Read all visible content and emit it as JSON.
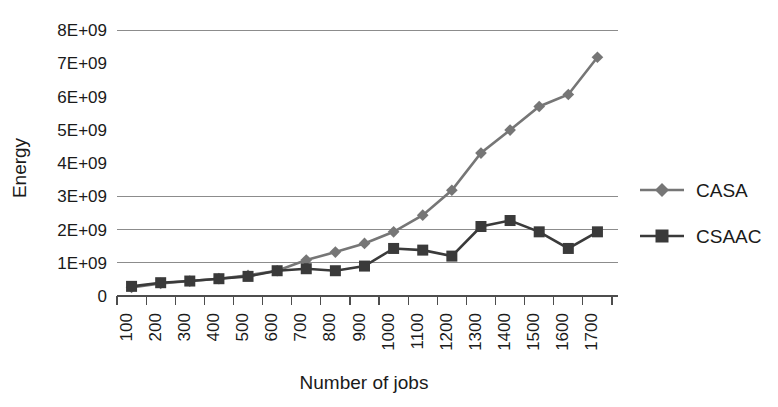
{
  "chart_data": {
    "type": "line",
    "title": "",
    "xlabel": "Number of jobs",
    "ylabel": "Energy",
    "x": [
      100,
      200,
      300,
      400,
      500,
      600,
      700,
      800,
      900,
      1000,
      1100,
      1200,
      1300,
      1400,
      1500,
      1600,
      1700
    ],
    "xtick_labels": [
      "100",
      "200",
      "300",
      "400",
      "500",
      "600",
      "700",
      "800",
      "900",
      "1000",
      "1100",
      "1200",
      "1300",
      "1400",
      "1500",
      "1600",
      "1700"
    ],
    "ytick_labels": [
      "0",
      "1E+09",
      "2E+09",
      "3E+09",
      "4E+09",
      "5E+09",
      "6E+09",
      "7E+09",
      "8E+09"
    ],
    "ytick_values": [
      0,
      1000000000,
      2000000000,
      3000000000,
      4000000000,
      5000000000,
      6000000000,
      7000000000,
      8000000000
    ],
    "ylim": [
      0,
      8000000000
    ],
    "grid": "horizontal",
    "gridlines_visible": [
      1000000000,
      2000000000,
      3000000000,
      8000000000
    ],
    "legend_position": "right",
    "series": [
      {
        "name": "CASA",
        "marker": "diamond",
        "color": "#767676",
        "values": [
          260000000,
          380000000,
          450000000,
          520000000,
          620000000,
          760000000,
          1080000000,
          1320000000,
          1580000000,
          1930000000,
          2430000000,
          3180000000,
          4300000000,
          4990000000,
          5700000000,
          6060000000,
          7180000000
        ]
      },
      {
        "name": "CSAAC",
        "marker": "square",
        "color": "#3a3a3a",
        "values": [
          290000000,
          400000000,
          450000000,
          520000000,
          590000000,
          760000000,
          820000000,
          760000000,
          900000000,
          1430000000,
          1380000000,
          1200000000,
          2090000000,
          2270000000,
          1930000000,
          1430000000,
          1930000000
        ]
      }
    ]
  },
  "legend": {
    "items": [
      {
        "label": "CASA"
      },
      {
        "label": "CSAAC"
      }
    ]
  },
  "axes": {
    "y_title": "Energy",
    "x_title": "Number of jobs"
  }
}
